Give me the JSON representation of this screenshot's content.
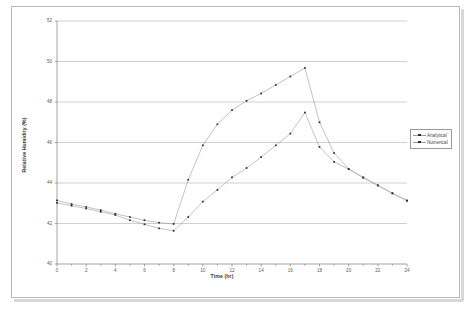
{
  "document": {
    "title": "Relative Humidity chart page"
  },
  "chart_data": {
    "type": "line",
    "title": "",
    "xlabel": "Time (hr)",
    "ylabel": "Relative Humidity (%)",
    "xlim": [
      0,
      24
    ],
    "ylim": [
      40,
      52
    ],
    "ytick_step": 2,
    "xtick_step": 2,
    "x_minor_tick_step": 1,
    "grid": "horizontal",
    "legend_position": "right-outside",
    "yticks": [
      "40",
      "42",
      "44",
      "46",
      "48",
      "50",
      "52"
    ],
    "xticks": [
      "0",
      "2",
      "4",
      "6",
      "8",
      "10",
      "12",
      "14",
      "16",
      "18",
      "20",
      "22",
      "24"
    ],
    "x": [
      0,
      1,
      2,
      3,
      4,
      5,
      6,
      7,
      8,
      9,
      10,
      11,
      12,
      13,
      14,
      15,
      16,
      17,
      18,
      19,
      20,
      21,
      22,
      23,
      24
    ],
    "series": [
      {
        "name": "Analytical",
        "color": "#9b9b9b",
        "marker": "square",
        "marker_color": "#2b2b2b",
        "values": [
          43.02,
          42.88,
          42.74,
          42.58,
          42.42,
          42.16,
          41.96,
          41.76,
          41.64,
          42.32,
          43.08,
          43.66,
          44.28,
          44.74,
          45.28,
          45.86,
          46.44,
          47.48,
          45.78,
          45.04,
          44.68,
          44.28,
          43.88,
          43.48,
          43.12
        ],
        "peak": {
          "x": 17,
          "y": 47.48
        },
        "min": {
          "x": 8,
          "y": 41.64
        }
      },
      {
        "name": "Numerical",
        "color": "#9b9b9b",
        "marker": "square",
        "marker_color": "#2b2b2b",
        "values": [
          43.14,
          42.96,
          42.82,
          42.66,
          42.48,
          42.32,
          42.16,
          42.04,
          41.98,
          44.16,
          45.86,
          46.9,
          47.6,
          48.06,
          48.42,
          48.84,
          49.26,
          49.68,
          47.0,
          45.48,
          44.7,
          44.26,
          43.88,
          43.5,
          43.14
        ],
        "peak": {
          "x": 17,
          "y": 49.68
        },
        "min": {
          "x": 8,
          "y": 41.98
        }
      }
    ],
    "legend": [
      "Analytical",
      "Numerical"
    ]
  },
  "colors": {
    "line": "#9b9b9b",
    "marker": "#2b2b2b",
    "grid": "#a8a8a8",
    "axis": "#7c7c7c",
    "frame": "#b9b9b9",
    "text": "#4a4a4a"
  }
}
